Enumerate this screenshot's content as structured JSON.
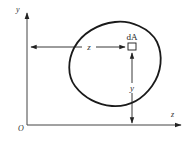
{
  "diagram": {
    "type": "cross-section-area-moment",
    "colors": {
      "stroke": "#1a1a1a",
      "axis": "#444444",
      "text": "#333333",
      "background": "#ffffff"
    },
    "axes": {
      "origin_label": "O",
      "vertical_axis_label": "y",
      "horizontal_axis_label": "z"
    },
    "region": {
      "shape": "closed-curve",
      "description": "arbitrary cross-section area"
    },
    "element": {
      "label": "dA",
      "shape": "small-square"
    },
    "dimensions": {
      "horizontal_distance_label": "z",
      "vertical_distance_label": "y"
    }
  }
}
